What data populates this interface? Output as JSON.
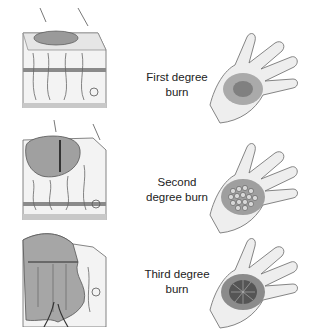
{
  "rows": [
    {
      "id": "first",
      "label_line1": "First degree",
      "label_line2": "burn",
      "burn_color": "#6d6d6d",
      "blisters": false
    },
    {
      "id": "second",
      "label_line1": "Second",
      "label_line2": "degree burn",
      "burn_color": "#555555",
      "blisters": true
    },
    {
      "id": "third",
      "label_line1": "Third degree",
      "label_line2": "burn",
      "burn_color": "#3f3f3f",
      "blisters": true
    }
  ],
  "colors": {
    "ink": "#444444",
    "skin_shade": "#d4d4d4",
    "background": "#ffffff"
  }
}
